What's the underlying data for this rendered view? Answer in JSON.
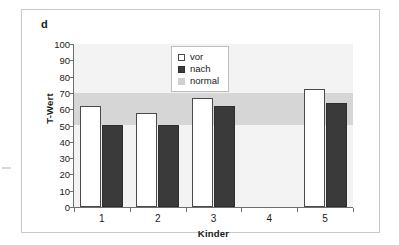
{
  "figure": {
    "panel_label": "d"
  },
  "legend": {
    "entries": [
      {
        "label": "vor",
        "swatch": "white-square-icon",
        "color": "#ffffff"
      },
      {
        "label": "nach",
        "swatch": "dark-square-icon",
        "color": "#3a3a3a"
      },
      {
        "label": "normal",
        "swatch": "light-gray-square-icon",
        "color": "#d0d0d0"
      }
    ]
  },
  "chart_data": {
    "type": "bar",
    "title": "",
    "subtitle": "",
    "xlabel": "Kinder",
    "ylabel": "T-Wert",
    "categories": [
      "1",
      "2",
      "3",
      "4",
      "5"
    ],
    "series": [
      {
        "name": "vor",
        "color": "#ffffff",
        "values": [
          62,
          57.5,
          67,
          null,
          72.5
        ]
      },
      {
        "name": "nach",
        "color": "#3a3a3a",
        "values": [
          50.5,
          50.5,
          62,
          null,
          64
        ]
      }
    ],
    "bands": [
      {
        "name": "normal",
        "from": 50,
        "to": 70,
        "color": "#d6d6d6"
      }
    ],
    "ylim": [
      0,
      100
    ],
    "ytick_step": 10,
    "yticks": [
      "0",
      "10",
      "20",
      "30",
      "40",
      "50",
      "60",
      "70",
      "80",
      "90",
      "100"
    ],
    "xticks": [
      "1",
      "2",
      "3",
      "4",
      "5"
    ],
    "grid": false,
    "legend_position": "top-center",
    "plot_background": "#f3f3f3"
  }
}
